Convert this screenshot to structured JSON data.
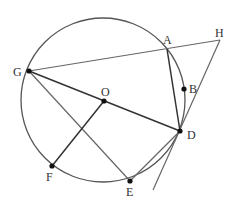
{
  "diagram": {
    "type": "circle-geometry",
    "circle": {
      "center": "O",
      "cx": 103,
      "cy": 100,
      "r": 82,
      "color": "#555555"
    },
    "points": [
      {
        "name": "A",
        "x": 167,
        "y": 49,
        "dot": false,
        "lx": 163,
        "ly": 44
      },
      {
        "name": "H",
        "x": 220,
        "y": 40,
        "dot": false,
        "lx": 215,
        "ly": 37
      },
      {
        "name": "B",
        "x": 184,
        "y": 89,
        "dot": true,
        "lx": 189,
        "ly": 93
      },
      {
        "name": "G",
        "x": 29,
        "y": 71,
        "dot": true,
        "lx": 13,
        "ly": 76
      },
      {
        "name": "O",
        "x": 104,
        "y": 101,
        "dot": true,
        "lx": 101,
        "ly": 96
      },
      {
        "name": "D",
        "x": 180,
        "y": 131,
        "dot": true,
        "lx": 187,
        "ly": 139
      },
      {
        "name": "F",
        "x": 52,
        "y": 166,
        "dot": true,
        "lx": 46,
        "ly": 181
      },
      {
        "name": "E",
        "x": 130,
        "y": 181,
        "dot": true,
        "lx": 126,
        "ly": 196
      }
    ],
    "segments": [
      {
        "from": "G",
        "to": "H",
        "x1": 29,
        "y1": 71,
        "x2": 220,
        "y2": 40,
        "color": "#666666",
        "w": 1.2
      },
      {
        "from": "G",
        "to": "D",
        "x1": 29,
        "y1": 71,
        "x2": 180,
        "y2": 131,
        "color": "#333333",
        "w": 1.5
      },
      {
        "from": "G",
        "to": "E",
        "x1": 29,
        "y1": 71,
        "x2": 130,
        "y2": 181,
        "color": "#666666",
        "w": 1.2
      },
      {
        "from": "O",
        "to": "F",
        "x1": 104,
        "y1": 101,
        "x2": 52,
        "y2": 166,
        "color": "#333333",
        "w": 1.5
      },
      {
        "from": "A",
        "to": "D",
        "x1": 167,
        "y1": 49,
        "x2": 180,
        "y2": 131,
        "color": "#333333",
        "w": 1.5
      },
      {
        "from": "E",
        "to": "D",
        "x1": 130,
        "y1": 181,
        "x2": 180,
        "y2": 131,
        "color": "#666666",
        "w": 1.2
      },
      {
        "from": "H",
        "to": "D-ext",
        "x1": 220,
        "y1": 40,
        "x2": 153,
        "y2": 190,
        "color": "#666666",
        "w": 1.2
      }
    ]
  }
}
